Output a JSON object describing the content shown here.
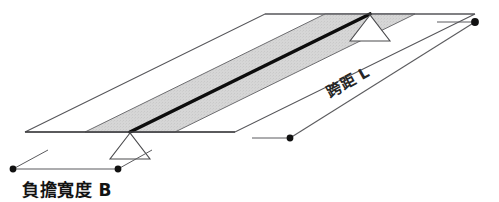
{
  "figure": {
    "title": "",
    "type": "structural-slab-beam-isometric-diagram",
    "background_color": "#ffffff",
    "labels": {
      "tributary_width": "負擔寬度 B",
      "span": "跨距 L"
    },
    "colors": {
      "slab_fill": "#ffffff",
      "band_fill": "#d4d4d4",
      "outline": "#4a4a4a",
      "beam_line": "#0d0d0d",
      "dimension_line": "#555555",
      "dot": "#111111",
      "text": "#131313"
    },
    "geometry": {
      "slab_corners": [
        [
          25,
          132
        ],
        [
          235,
          132
        ],
        [
          475,
          14
        ],
        [
          265,
          14
        ]
      ],
      "band_corners": [
        [
          85,
          132
        ],
        [
          175,
          132
        ],
        [
          415,
          14
        ],
        [
          325,
          14
        ]
      ],
      "beam_line": [
        [
          130,
          132
        ],
        [
          370,
          14
        ]
      ],
      "support_left": {
        "apex_x": 130,
        "apex_y": 133,
        "half_width": 20,
        "height": 26
      },
      "support_right": {
        "apex_x": 370,
        "apex_y": 15,
        "half_width": 20,
        "height": 26
      },
      "dim_b": {
        "dot_left": [
          13,
          169
        ],
        "dot_right": [
          118,
          169
        ],
        "leader_left_to": [
          48,
          150
        ],
        "leader_right_to": [
          152,
          150
        ]
      },
      "dim_l": {
        "dot_lower": [
          290,
          138
        ],
        "dot_upper": [
          475,
          22
        ],
        "leader_lower_from": [
          252,
          138
        ],
        "leader_upper_from": [
          437,
          22
        ]
      }
    }
  }
}
